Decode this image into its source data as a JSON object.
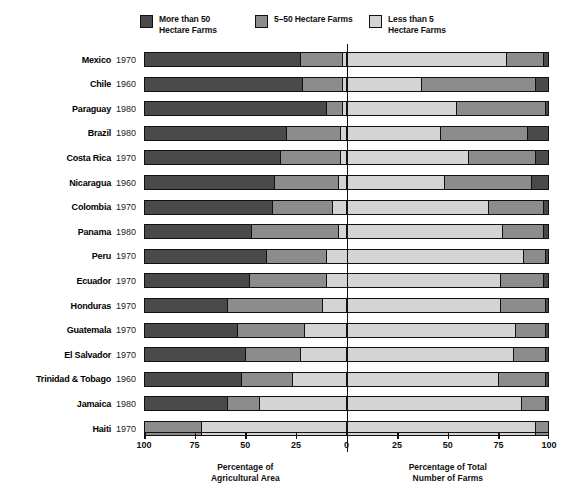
{
  "legend": {
    "items": [
      {
        "label": "More than 50\nHectare Farms",
        "color": "#4a4a4a",
        "x": 0
      },
      {
        "label": "5–50 Hectare Farms",
        "color": "#8c8c8c",
        "x": 115
      },
      {
        "label": "Less than 5\nHectare Farms",
        "color": "#d4d4d4",
        "x": 229
      }
    ]
  },
  "axis": {
    "ticks": [
      {
        "label": "100",
        "pos": 0
      },
      {
        "label": "75",
        "pos": 50.6
      },
      {
        "label": "50",
        "pos": 101.3
      },
      {
        "label": "25",
        "pos": 151.9
      },
      {
        "label": "0",
        "pos": 202.5
      },
      {
        "label": "25",
        "pos": 253.1
      },
      {
        "label": "50",
        "pos": 303.8
      },
      {
        "label": "75",
        "pos": 354.4
      },
      {
        "label": "100",
        "pos": 405
      }
    ],
    "left_title": "Percentage of\nAgricultural Area",
    "right_title": "Percentage of Total\nNumber of Farms",
    "left_title_pos": 101.3,
    "right_title_pos": 303.8
  },
  "chart_data": {
    "type": "bar",
    "title": "",
    "subtitle": "",
    "orientation": "horizontal",
    "layout": "diverging-stacked",
    "xlabel_left": "Percentage of Agricultural Area",
    "xlabel_right": "Percentage of Total Number of Farms",
    "ylabel": "",
    "grid": false,
    "legend_position": "top",
    "xlim_left": [
      100,
      0
    ],
    "xlim_right": [
      0,
      100
    ],
    "series": [
      {
        "name": "More than 50 Hectare Farms",
        "color": "#4a4a4a"
      },
      {
        "name": "5–50 Hectare Farms",
        "color": "#8c8c8c"
      },
      {
        "name": "Less than 5 Hectare Farms",
        "color": "#d4d4d4"
      }
    ],
    "note": "Left half = share of agricultural AREA (read right-to-left from 100 at far left to 0 at centre). Right half = share of NUMBER of farms (0 at centre to 100 at far right). Each half sums to 100 percent.",
    "rows": [
      {
        "country": "Mexico",
        "year": "1970",
        "area": [
          77.0,
          21.0,
          2.0
        ],
        "farms": [
          3.0,
          18.0,
          79.0
        ]
      },
      {
        "country": "Chile",
        "year": "1960",
        "area": [
          78.0,
          20.0,
          2.0
        ],
        "farms": [
          7.0,
          56.0,
          37.0
        ]
      },
      {
        "country": "Paraguay",
        "year": "1980",
        "area": [
          90.0,
          8.0,
          2.0
        ],
        "farms": [
          2.0,
          44.0,
          54.0
        ]
      },
      {
        "country": "Brazil",
        "year": "1980",
        "area": [
          70.0,
          27.0,
          3.0
        ],
        "farms": [
          11.0,
          43.0,
          46.0
        ]
      },
      {
        "country": "Costa Rica",
        "year": "1970",
        "area": [
          67.0,
          30.0,
          3.0
        ],
        "farms": [
          7.0,
          33.0,
          60.0
        ]
      },
      {
        "country": "Nicaragua",
        "year": "1960",
        "area": [
          64.0,
          32.0,
          4.0
        ],
        "farms": [
          9.0,
          43.0,
          48.0
        ]
      },
      {
        "country": "Colombia",
        "year": "1970",
        "area": [
          63.0,
          30.0,
          7.0
        ],
        "farms": [
          3.0,
          27.0,
          70.0
        ]
      },
      {
        "country": "Panama",
        "year": "1980",
        "area": [
          53.0,
          43.0,
          4.0
        ],
        "farms": [
          3.0,
          20.0,
          77.0
        ]
      },
      {
        "country": "Peru",
        "year": "1970",
        "area": [
          60.0,
          30.0,
          10.0
        ],
        "farms": [
          2.0,
          11.0,
          87.0
        ]
      },
      {
        "country": "Ecuador",
        "year": "1970",
        "area": [
          52.0,
          38.0,
          10.0
        ],
        "farms": [
          3.0,
          21.0,
          76.0
        ]
      },
      {
        "country": "Honduras",
        "year": "1970",
        "area": [
          41.0,
          47.0,
          12.0
        ],
        "farms": [
          2.0,
          22.0,
          76.0
        ]
      },
      {
        "country": "Guatemala",
        "year": "1970",
        "area": [
          46.0,
          33.0,
          21.0
        ],
        "farms": [
          2.0,
          15.0,
          83.0
        ]
      },
      {
        "country": "El Salvador",
        "year": "1970",
        "area": [
          50.0,
          27.0,
          23.0
        ],
        "farms": [
          2.0,
          16.0,
          82.0
        ]
      },
      {
        "country": "Trinidad & Tobago",
        "year": "1960",
        "area": [
          48.0,
          25.0,
          27.0
        ],
        "farms": [
          2.0,
          23.0,
          75.0
        ]
      },
      {
        "country": "Jamaica",
        "year": "1980",
        "area": [
          41.0,
          16.0,
          43.0
        ],
        "farms": [
          2.0,
          12.0,
          86.0
        ]
      },
      {
        "country": "Haiti",
        "year": "1970",
        "area": [
          0.0,
          28.0,
          72.0
        ],
        "farms": [
          0.0,
          7.0,
          93.0
        ]
      }
    ]
  }
}
